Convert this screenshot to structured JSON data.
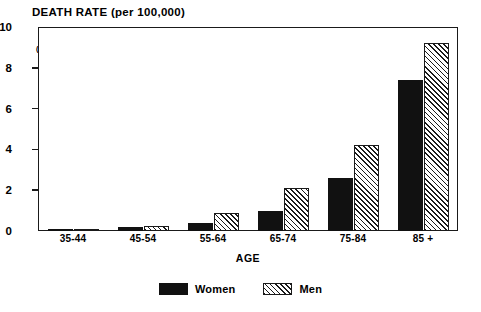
{
  "chart_data": {
    "type": "bar",
    "title": "DEATH RATE (per 100,000)",
    "units_note": "(thousands)",
    "xlabel": "AGE",
    "ylabel": "",
    "categories": [
      "35-44",
      "45-54",
      "55-64",
      "65-74",
      "75-84",
      "85 +"
    ],
    "series": [
      {
        "name": "Women",
        "values": [
          0.1,
          0.2,
          0.4,
          1.0,
          2.6,
          7.4
        ],
        "fill": "solid-black",
        "color": "#111111"
      },
      {
        "name": "Men",
        "values": [
          0.1,
          0.25,
          0.9,
          2.1,
          4.2,
          9.2
        ],
        "fill": "diagonal-hatch",
        "color": "#1a1a1a"
      }
    ],
    "ylim": [
      0,
      10
    ],
    "yticks": [
      0,
      2,
      4,
      6,
      8,
      10
    ],
    "ytick_labels": [
      "0",
      "2",
      "4",
      "6",
      "8",
      "10"
    ],
    "grid": false,
    "legend_position": "bottom-center",
    "frame": true
  },
  "legend": {
    "entries": [
      {
        "label": "Women"
      },
      {
        "label": "Men"
      }
    ]
  }
}
